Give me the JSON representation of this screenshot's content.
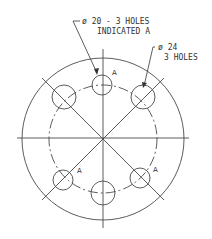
{
  "drawing": {
    "callout_small": {
      "line1": "ø 20 - 3 HOLES",
      "line2": "INDICATED A"
    },
    "callout_large": {
      "line1": "ø 24",
      "line2": "3 HOLES"
    },
    "hole_marker": "A"
  },
  "geometry": {
    "center": [
      103,
      139
    ],
    "outer_radius": 81,
    "bolt_circle_radius": 54,
    "small_holes": [
      {
        "cx": 102,
        "cy": 85,
        "r": 10
      },
      {
        "cx": 63,
        "cy": 180,
        "r": 10
      },
      {
        "cx": 140,
        "cy": 178,
        "r": 10
      }
    ],
    "large_holes": [
      {
        "cx": 64,
        "cy": 97,
        "r": 12
      },
      {
        "cx": 143,
        "cy": 97,
        "r": 12
      },
      {
        "cx": 103,
        "cy": 193,
        "r": 12
      }
    ]
  }
}
